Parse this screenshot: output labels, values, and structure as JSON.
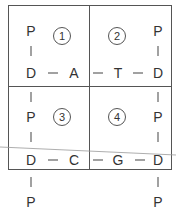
{
  "diagram": {
    "quadrants": [
      {
        "number": "1"
      },
      {
        "number": "2"
      },
      {
        "number": "3"
      },
      {
        "number": "4"
      }
    ],
    "nodes": {
      "p_top_left": "P",
      "p_top_right": "P",
      "d_row1_left": "D",
      "a_row1": "A",
      "t_row1": "T",
      "d_row1_right": "D",
      "p_mid_left": "P",
      "p_mid_right": "P",
      "d_row2_left": "D",
      "c_row2": "C",
      "g_row2": "G",
      "d_row2_right": "D",
      "p_bottom_left": "P",
      "p_bottom_right": "P"
    },
    "colors": {
      "line": "#555555",
      "text": "#333333",
      "background": "#ffffff"
    }
  }
}
